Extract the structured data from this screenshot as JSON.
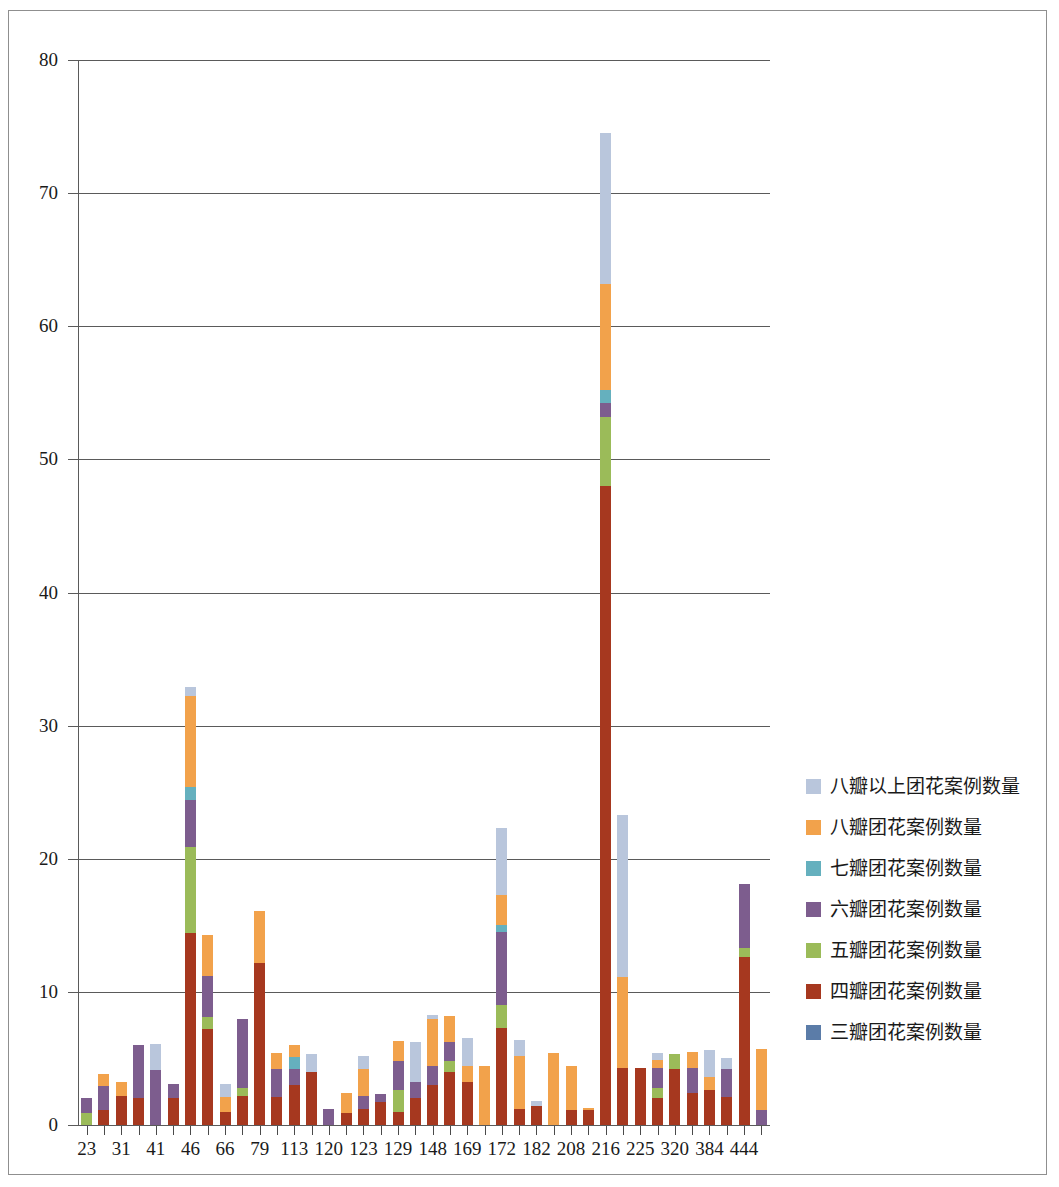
{
  "chart_data": {
    "type": "bar",
    "stacked": true,
    "title": "",
    "xlabel": "",
    "ylabel": "",
    "ylim": [
      0,
      80
    ],
    "ytick_labels": [
      "0",
      "10",
      "20",
      "30",
      "40",
      "50",
      "60",
      "70",
      "80"
    ],
    "ytick_values": [
      0,
      10,
      20,
      30,
      40,
      50,
      60,
      70,
      80
    ],
    "grid": true,
    "legend_position": "right",
    "categories": [
      "23",
      "",
      "31",
      "",
      "41",
      "",
      "46",
      "",
      "66",
      "",
      "79",
      "",
      "113",
      "",
      "120",
      "",
      "123",
      "",
      "129",
      "",
      "148",
      "",
      "169",
      "",
      "172",
      "",
      "182",
      "",
      "208",
      "",
      "216",
      "",
      "225",
      "",
      "320",
      "",
      "384",
      "",
      "444",
      ""
    ],
    "visible_xtick_labels": [
      "23",
      "31",
      "41",
      "46",
      "66",
      "79",
      "113",
      "120",
      "123",
      "129",
      "148",
      "169",
      "172",
      "182",
      "208",
      "216",
      "225",
      "320",
      "384",
      "444"
    ],
    "series": [
      {
        "name": "三瓣团花案例数量",
        "color": "#5B7CA8",
        "values": [
          0,
          0,
          0,
          0,
          0,
          0,
          0,
          0,
          0,
          0,
          0,
          0,
          0,
          0,
          0,
          0,
          0,
          0,
          0,
          0,
          0,
          0,
          0,
          0,
          0,
          0,
          0,
          0,
          0,
          0,
          0,
          0,
          0,
          0,
          0,
          0,
          0,
          0,
          0,
          0
        ]
      },
      {
        "name": "四瓣团花案例数量",
        "color": "#A6381F",
        "values": [
          0,
          1.1,
          2.2,
          2.0,
          0,
          2.0,
          14.4,
          7.2,
          1.0,
          2.2,
          12.2,
          2.1,
          3.0,
          4.0,
          0,
          0.9,
          1.2,
          1.7,
          1.0,
          2.0,
          3.0,
          4.0,
          3.2,
          0,
          7.3,
          1.2,
          1.4,
          0,
          1.1,
          1.1,
          48.0,
          4.3,
          4.3,
          2.0,
          4.2,
          2.4,
          2.6,
          2.1,
          12.6,
          0
        ]
      },
      {
        "name": "五瓣团花案例数量",
        "color": "#9BBB59",
        "values": [
          0.9,
          0,
          0,
          0,
          0,
          0,
          6.5,
          0.9,
          0,
          0.6,
          0,
          0,
          0,
          0,
          0,
          0,
          0,
          0,
          1.6,
          0,
          0,
          0.8,
          0,
          0,
          1.7,
          0,
          0,
          0,
          0,
          0,
          5.2,
          0,
          0,
          0.8,
          1.1,
          0,
          0,
          0,
          0.7,
          0
        ]
      },
      {
        "name": "六瓣团花案例数量",
        "color": "#7D5D8E",
        "values": [
          1.1,
          1.8,
          0,
          4.0,
          4.1,
          1.1,
          3.5,
          3.1,
          0,
          5.2,
          0,
          2.1,
          1.2,
          0,
          1.2,
          0,
          1.0,
          0.6,
          2.2,
          1.2,
          1.4,
          1.4,
          0,
          0,
          5.5,
          0,
          0,
          0,
          0,
          0,
          1.0,
          0,
          0,
          1.5,
          0,
          1.9,
          0,
          2.1,
          4.8,
          1.1
        ]
      },
      {
        "name": "七瓣团花案例数量",
        "color": "#65B0BE",
        "values": [
          0,
          0,
          0,
          0,
          0,
          0,
          1.0,
          0,
          0,
          0,
          0,
          0,
          0.9,
          0,
          0,
          0,
          0,
          0,
          0,
          0,
          0,
          0,
          0,
          0,
          0.5,
          0,
          0,
          0,
          0,
          0,
          1.0,
          0,
          0,
          0,
          0,
          0,
          0,
          0,
          0,
          0
        ]
      },
      {
        "name": "八瓣团花案例数量",
        "color": "#F2A24B",
        "values": [
          0,
          0.9,
          1.0,
          0,
          0,
          0,
          6.8,
          3.1,
          1.1,
          0,
          3.9,
          1.2,
          0.9,
          0,
          0,
          1.5,
          2.0,
          0,
          1.5,
          0,
          3.6,
          2.0,
          1.2,
          4.4,
          2.3,
          4.0,
          0,
          5.4,
          3.3,
          0.2,
          8.0,
          6.8,
          0,
          0.6,
          0,
          1.2,
          1.0,
          0,
          0,
          4.6
        ]
      },
      {
        "name": "八瓣以上团花案例数量",
        "color": "#B9C6DC",
        "values": [
          0,
          0,
          0,
          0,
          2.0,
          0,
          0.7,
          0,
          1.0,
          0,
          0,
          0,
          0,
          1.3,
          0,
          0,
          1.0,
          0,
          0,
          3.0,
          0.3,
          0,
          2.1,
          0,
          5.0,
          1.2,
          0.4,
          0,
          0,
          0,
          11.3,
          12.2,
          0,
          0.5,
          0,
          0,
          2.0,
          0.8,
          0,
          0
        ]
      }
    ],
    "totals": [
      2.0,
      3.8,
      3.2,
      6.0,
      6.1,
      3.1,
      33.0,
      14.3,
      3.1,
      8.0,
      16.1,
      5.4,
      6.0,
      5.3,
      3.1,
      2.4,
      5.2,
      2.3,
      6.3,
      6.2,
      8.3,
      8.2,
      6.5,
      4.4,
      22.3,
      6.4,
      1.8,
      5.4,
      4.4,
      1.3,
      74.5,
      23.3,
      4.3,
      5.4,
      5.3,
      5.5,
      5.6,
      5.0,
      18.1,
      5.7
    ]
  },
  "legend": {
    "entries": [
      {
        "label": "八瓣以上团花案例数量",
        "color": "#B9C6DC"
      },
      {
        "label": "八瓣团花案例数量",
        "color": "#F2A24B"
      },
      {
        "label": "七瓣团花案例数量",
        "color": "#65B0BE"
      },
      {
        "label": "六瓣团花案例数量",
        "color": "#7D5D8E"
      },
      {
        "label": "五瓣团花案例数量",
        "color": "#9BBB59"
      },
      {
        "label": "四瓣团花案例数量",
        "color": "#A6381F"
      },
      {
        "label": "三瓣团花案例数量",
        "color": "#5B7CA8"
      }
    ]
  }
}
